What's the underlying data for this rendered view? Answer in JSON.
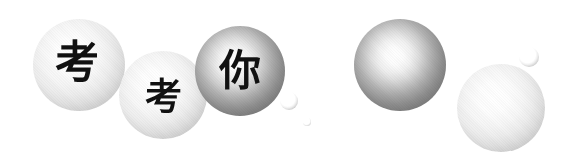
{
  "image": {
    "kind": "decorative-bubble-graphic",
    "background_color": "#ffffff",
    "width": 569,
    "height": 164,
    "phrase": "考考你"
  },
  "bubbles": [
    {
      "id": "bubble-kao-1",
      "label": "考",
      "tone": "light",
      "cx": 79,
      "cy": 65,
      "r": 46,
      "glyph_size": 44,
      "glyph_dx": -2,
      "glyph_dy": -2
    },
    {
      "id": "bubble-kao-2",
      "label": "考",
      "tone": "light",
      "cx": 163,
      "cy": 95,
      "r": 44,
      "glyph_size": 37,
      "glyph_dx": 0,
      "glyph_dy": 2
    },
    {
      "id": "bubble-ni",
      "label": "你",
      "tone": "dark",
      "cx": 240,
      "cy": 71,
      "r": 45,
      "glyph_size": 42,
      "glyph_dx": 0,
      "glyph_dy": 0
    },
    {
      "id": "bubble-plain-dark",
      "label": "",
      "tone": "dark",
      "cx": 400,
      "cy": 65,
      "r": 46,
      "glyph_size": 0,
      "glyph_dx": 0,
      "glyph_dy": 0
    },
    {
      "id": "bubble-plain-light",
      "label": "",
      "tone": "light",
      "cx": 501,
      "cy": 108,
      "r": 44,
      "glyph_size": 0,
      "glyph_dx": 0,
      "glyph_dy": 0
    }
  ],
  "mini_bubbles": [
    {
      "id": "mini-bubble-1",
      "cx": 289,
      "cy": 101,
      "r": 9,
      "tiny": false
    },
    {
      "id": "mini-bubble-2",
      "cx": 307,
      "cy": 122,
      "r": 4,
      "tiny": true
    },
    {
      "id": "mini-bubble-3",
      "cx": 529,
      "cy": 57,
      "r": 10,
      "tiny": false
    }
  ],
  "colors": {
    "background": "#ffffff",
    "glyph": "#111111",
    "light_rim": "#ababab",
    "dark_rim": "#747474",
    "highlight": "#ffffff"
  }
}
